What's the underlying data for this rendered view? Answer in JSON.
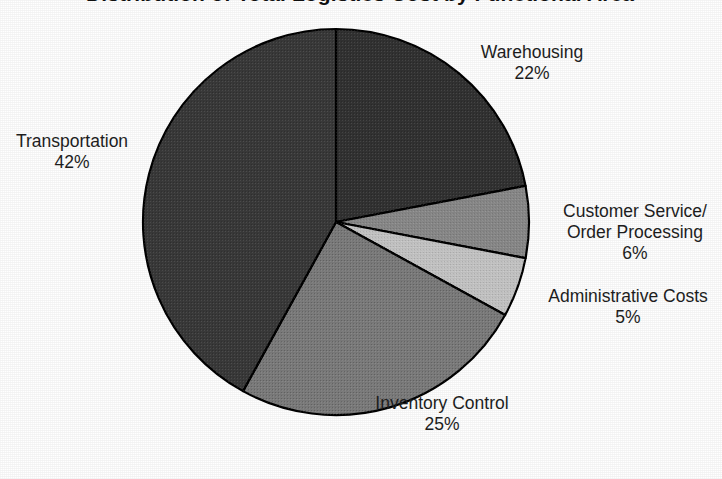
{
  "figure": {
    "title": "Distribution of Total Logistics Cost by Functional Area",
    "background_color": "#ffffff",
    "text_color": "#1e1e1e"
  },
  "chart_data": {
    "type": "pie",
    "title": "Distribution of Total Logistics Cost by Functional Area",
    "xlabel": "",
    "ylabel": "",
    "units": "percent",
    "total": 100,
    "start_angle_deg": 0,
    "direction": "clockwise",
    "legend": "none",
    "grid": false,
    "labels_position": "outside",
    "categories": [
      "Warehousing",
      "Customer Service/ Order Processing",
      "Administrative Costs",
      "Inventory Control",
      "Transportation"
    ],
    "values": [
      22,
      6,
      5,
      25,
      42
    ],
    "colors": [
      "#333333",
      "#8a8a8a",
      "#c6c6c6",
      "#7d7d7d",
      "#3a3a3a"
    ],
    "slices": [
      {
        "name": "Warehousing",
        "value": 22,
        "value_text": "22%",
        "color": "#333333",
        "start_angle_deg": 0,
        "end_angle_deg": 79.2
      },
      {
        "name": "Customer Service/ Order Processing",
        "name_line1": "Customer Service/",
        "name_line2": "Order Processing",
        "value": 6,
        "value_text": "6%",
        "color": "#8a8a8a",
        "start_angle_deg": 79.2,
        "end_angle_deg": 100.8
      },
      {
        "name": "Administrative Costs",
        "value": 5,
        "value_text": "5%",
        "color": "#c6c6c6",
        "start_angle_deg": 100.8,
        "end_angle_deg": 118.8
      },
      {
        "name": "Inventory Control",
        "value": 25,
        "value_text": "25%",
        "color": "#7d7d7d",
        "start_angle_deg": 118.8,
        "end_angle_deg": 208.8
      },
      {
        "name": "Transportation",
        "value": 42,
        "value_text": "42%",
        "color": "#3a3a3a",
        "start_angle_deg": 208.8,
        "end_angle_deg": 360
      }
    ]
  },
  "geometry": {
    "center_x": 336,
    "center_y": 222,
    "radius": 193,
    "stroke_color": "#000000",
    "stroke_width": 2.2
  },
  "labels": {
    "warehousing": {
      "name": "Warehousing",
      "value": "22%"
    },
    "transportation": {
      "name": "Transportation",
      "value": "42%"
    },
    "customer_service": {
      "line1": "Customer Service/",
      "line2": "Order Processing",
      "value": "6%"
    },
    "administrative": {
      "name": "Administrative Costs",
      "value": "5%"
    },
    "inventory": {
      "name": "Inventory Control",
      "value": "25%"
    }
  }
}
